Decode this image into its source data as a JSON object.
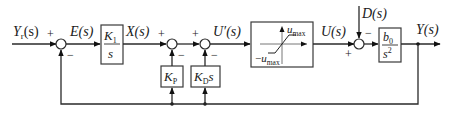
{
  "diagram": {
    "type": "control-block-diagram",
    "signals": {
      "input": "Y_r(s)",
      "error": "E(s)",
      "integrator_out": "X(s)",
      "control_pre_sat": "U'(s)",
      "control": "U(s)",
      "disturbance": "D(s)",
      "output": "Y(s)"
    },
    "labels": {
      "yr_main": "Y",
      "yr_sub": "r",
      "yr_arg": "(s)",
      "e": "E(s)",
      "x": "X(s)",
      "uprime": "U′(s)",
      "u": "U(s)",
      "d": "D(s)",
      "y": "Y(s)"
    },
    "blocks": {
      "integrator": {
        "num_main": "K",
        "num_sub": "1",
        "den": "s"
      },
      "kp": {
        "main": "K",
        "sub": "P"
      },
      "kd": {
        "main": "K",
        "sub": "D",
        "suffix": "s"
      },
      "saturation": {
        "upper_main": "u",
        "upper_sub": "max",
        "lower_prefix": "−",
        "lower_main": "u",
        "lower_sub": "max"
      },
      "plant": {
        "num_main": "b",
        "num_sub": "0",
        "den_main": "s",
        "den_sup": "2"
      }
    },
    "summing_junctions": [
      {
        "id": "sum1",
        "signs": {
          "left": "+",
          "bottom": "−"
        }
      },
      {
        "id": "sum2",
        "signs": {
          "left": "+",
          "bottom": "−"
        }
      },
      {
        "id": "sum3",
        "signs": {
          "left": "+",
          "bottom": "−"
        }
      },
      {
        "id": "sum4",
        "signs": {
          "left": "+",
          "top": "−"
        }
      }
    ]
  }
}
